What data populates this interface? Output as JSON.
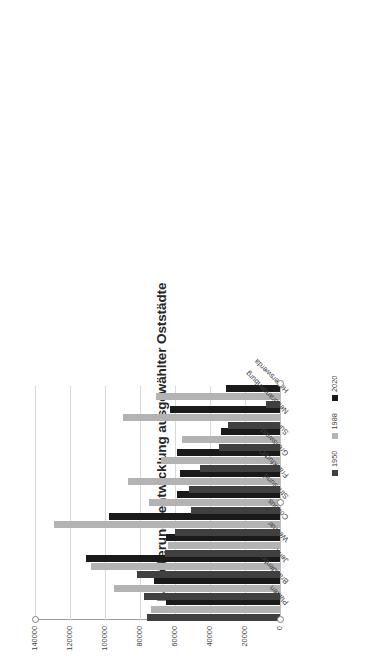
{
  "chart_data": {
    "type": "bar",
    "orientation": "horizontal-rotated",
    "title": "Bevölkerungsentwicklung ausgewählter Oststädte",
    "xlabel": "",
    "ylabel": "",
    "categories": [
      "Plauen",
      "Brandenburg",
      "Jena",
      "Weimar",
      "Cottbus",
      "Stralsund",
      "Frankfurt/O",
      "Greifswald",
      "Suhl",
      "Neubrandenburg",
      "Hoyerswerda"
    ],
    "series": [
      {
        "name": "1950",
        "color": "#404040",
        "values": [
          76000,
          78000,
          82000,
          66000,
          60000,
          51000,
          52000,
          46000,
          35000,
          30000,
          8000
        ]
      },
      {
        "name": "1988",
        "color": "#b3b3b3",
        "values": [
          74000,
          95000,
          108000,
          64000,
          129000,
          75000,
          87000,
          68000,
          56000,
          90000,
          71000
        ]
      },
      {
        "name": "2020",
        "color": "#1a1a1a",
        "values": [
          65000,
          72000,
          111000,
          65000,
          98000,
          59000,
          57000,
          59000,
          34000,
          63000,
          31000
        ]
      }
    ],
    "axis_ticks": [
      "0",
      "20000",
      "40000",
      "60000",
      "80000",
      "100000",
      "120000",
      "140000"
    ],
    "axis_min": 0,
    "axis_max": 140000,
    "grid": true,
    "legend_position": "bottom",
    "legend_entries": [
      "1950",
      "1988",
      "2020"
    ]
  },
  "legend": {
    "items": [
      {
        "label": "1950",
        "color": "#404040"
      },
      {
        "label": "1988",
        "color": "#b3b3b3"
      },
      {
        "label": "2020",
        "color": "#1a1a1a"
      }
    ]
  }
}
